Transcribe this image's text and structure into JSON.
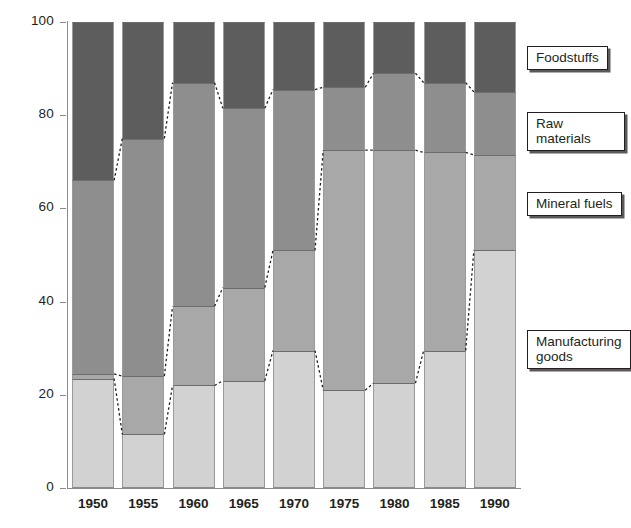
{
  "chart_data": {
    "type": "bar",
    "title": "",
    "subtitle": "",
    "xlabel": "",
    "ylabel": "Percent of imports (by value)",
    "ylim": [
      0,
      100
    ],
    "yticks": [
      0,
      20,
      40,
      60,
      80,
      100
    ],
    "grid": false,
    "stacked": true,
    "legend_position": "right-callouts",
    "categories": [
      "1950",
      "1955",
      "1960",
      "1965",
      "1970",
      "1975",
      "1980",
      "1985",
      "1990"
    ],
    "series": [
      {
        "name": "Manufacturing goods",
        "color": "#d2d2d2",
        "values": [
          23.5,
          11.5,
          22,
          23,
          29.5,
          21,
          22.5,
          29.5,
          51
        ]
      },
      {
        "name": "Mineral fuels",
        "color": "#a8a8a8",
        "values": [
          1,
          12.5,
          17,
          20,
          21.5,
          51.5,
          50,
          42.5,
          20.5
        ]
      },
      {
        "name": "Raw materials",
        "color": "#8e8e8e",
        "values": [
          41.5,
          51,
          48,
          38.5,
          34.5,
          13.5,
          16.5,
          15,
          13.5
        ]
      },
      {
        "name": "Foodstuffs",
        "color": "#5d5d5d",
        "values": [
          34,
          25,
          13,
          18.5,
          14.5,
          14,
          11,
          13,
          15
        ]
      }
    ],
    "cumulative_tops": {
      "manufacturing_goods": [
        23.5,
        11.5,
        22,
        23,
        29.5,
        21,
        22.5,
        29.5,
        51
      ],
      "mineral_fuels": [
        24.5,
        24,
        39,
        43,
        51,
        72.5,
        72.5,
        72,
        71.5
      ],
      "raw_materials": [
        66,
        75,
        87,
        81.5,
        85.5,
        86,
        89,
        87,
        85
      ],
      "foodstuffs": [
        100,
        100,
        100,
        100,
        100,
        100,
        100,
        100,
        100
      ]
    }
  },
  "legend": {
    "items": [
      {
        "label": "Foodstuffs"
      },
      {
        "label": "Raw materials"
      },
      {
        "label": "Mineral fuels"
      },
      {
        "label": "Manufacturing\ngoods"
      }
    ]
  }
}
